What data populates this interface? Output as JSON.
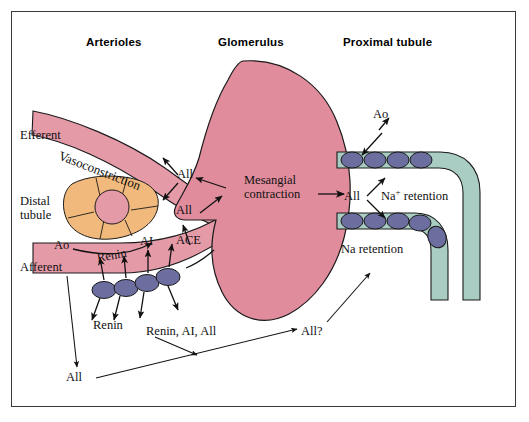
{
  "figure": {
    "colors": {
      "vessel_pink": "#e59aa8",
      "glomerulus_pink": "#e08c9c",
      "macula_orange": "#f2b97c",
      "tubule_teal": "#a9ccc3",
      "cell_blue": "#6c6e9f",
      "outline": "#1a1a1a",
      "frame": "#3a3a3a",
      "background": "#ffffff"
    }
  },
  "headers": [
    {
      "label": "Arterioles"
    },
    {
      "label": "Glomerulus"
    },
    {
      "label": "Proximal tubule"
    }
  ],
  "structures": {
    "efferent_arteriole": "Efferent",
    "afferent_arteriole": "Afferent",
    "distal_tubule_line1": "Distal",
    "distal_tubule_line2": "tubule",
    "macula_densa": "macula-densa-cells",
    "glomerulus": "glomerulus",
    "proximal_tubule": "proximal-tubule",
    "juxtaglomerular_cells": "juxtaglomerular-granular-cells",
    "brush_border_cells": "proximal-tubule-epithelial-cells"
  },
  "annotations": {
    "vasoconstriction": "Vasoconstriction",
    "aii_efferent": "All",
    "aii_afferent": "All",
    "mesangial_line1": "Mesangial",
    "mesangial_line2": "contraction",
    "ao_afferent": "Ao",
    "renin_arrow": "Renin",
    "ai": "AI",
    "ace": "ACE",
    "ao_proximal": "Ao",
    "aii_proximal": "All",
    "na_plus_retention_pre": "Na",
    "na_plus_retention_sup": "+",
    "na_plus_retention_post": " retention",
    "na_retention": "Na retention",
    "renin_secretion": "Renin",
    "renin_ai_aii": "Renin, AI, All",
    "aii_question": "All?",
    "aii_bottom": "All"
  }
}
